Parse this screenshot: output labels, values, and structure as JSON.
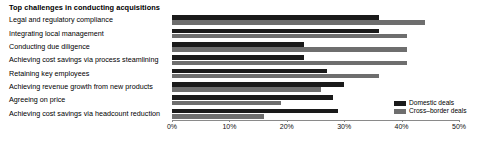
{
  "chart_data": {
    "type": "bar",
    "orientation": "horizontal",
    "title": "Top challenges in conducting acquisitions",
    "xlabel": "",
    "ylabel": "",
    "xlim": [
      0,
      50
    ],
    "xticks": [
      "0%",
      "10%",
      "20%",
      "30%",
      "40%",
      "50%"
    ],
    "xtick_values": [
      0,
      10,
      20,
      30,
      40,
      50
    ],
    "grid": false,
    "legend_position": "bottom-right",
    "categories": [
      "Legal and regulatory compliance",
      "Integrating local management",
      "Conducting due diligence",
      "Achieving cost savings via process steamlining",
      "Retaining key employees",
      "Achieving revenue growth from new products",
      "Agreeing on price",
      "Achieving cost savings via headcount reduction"
    ],
    "series": [
      {
        "name": "Domestic deals",
        "color": "#1a1a1a",
        "values": [
          36,
          36,
          23,
          23,
          27,
          30,
          28,
          29
        ]
      },
      {
        "name": "Cross–border deals",
        "color": "#6e6e6e",
        "values": [
          44,
          41,
          41,
          41,
          36,
          26,
          19,
          16
        ]
      }
    ]
  },
  "legend": {
    "items": [
      {
        "label": "Domestic deals",
        "color": "#1a1a1a"
      },
      {
        "label": "Cross–border deals",
        "color": "#6e6e6e"
      }
    ]
  }
}
